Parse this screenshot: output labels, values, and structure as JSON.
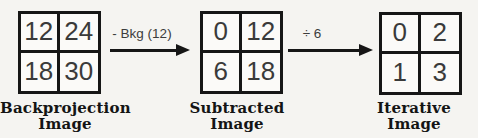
{
  "diagram": {
    "title_implicit": "Iterative reconstruction arithmetic example",
    "stages": [
      {
        "name": "backprojection",
        "label_line1": "Backprojection",
        "label_line2": "Image",
        "cells": [
          "12",
          "24",
          "18",
          "30"
        ]
      },
      {
        "name": "subtracted",
        "label_line1": "Subtracted",
        "label_line2": "Image",
        "cells": [
          "0",
          "12",
          "6",
          "18"
        ]
      },
      {
        "name": "iterative",
        "label_line1": "Iterative",
        "label_line2": "Image",
        "cells": [
          "0",
          "2",
          "1",
          "3"
        ]
      }
    ],
    "arrows": [
      {
        "label": "- Bkg (12)"
      },
      {
        "label": "÷ 6"
      }
    ],
    "colors": {
      "background": "#f5f4f1",
      "line": "#161616",
      "cell_text": "#3a3a3a",
      "label_text": "#141414"
    }
  }
}
